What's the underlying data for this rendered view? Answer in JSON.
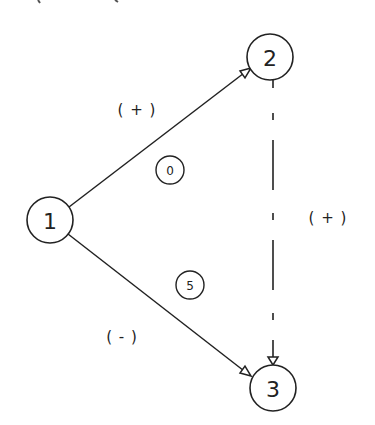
{
  "diagram": {
    "nodes": [
      {
        "id": "1",
        "label": "1",
        "cx": 50,
        "cy": 220,
        "r": 23
      },
      {
        "id": "2",
        "label": "2",
        "cx": 270,
        "cy": 57,
        "r": 23
      },
      {
        "id": "3",
        "label": "3",
        "cx": 273,
        "cy": 388,
        "r": 23
      }
    ],
    "edges": [
      {
        "from": "1",
        "to": "2",
        "style": "solid",
        "sign": "( + )",
        "weight": "0"
      },
      {
        "from": "1",
        "to": "3",
        "style": "solid",
        "sign": "( - )",
        "weight": "5"
      },
      {
        "from": "2",
        "to": "3",
        "style": "dashed",
        "sign": "( + )"
      }
    ],
    "weights": [
      {
        "label": "0",
        "cx": 170,
        "cy": 170,
        "r": 14
      },
      {
        "label": "5",
        "cx": 190,
        "cy": 285,
        "r": 14
      }
    ],
    "sign_labels": [
      {
        "text": "( + )",
        "x": 137,
        "y": 110
      },
      {
        "text": "( + )",
        "x": 328,
        "y": 218
      },
      {
        "text": "( - )",
        "x": 122,
        "y": 337
      }
    ],
    "stroke_color": "#222222",
    "background": "#ffffff"
  }
}
